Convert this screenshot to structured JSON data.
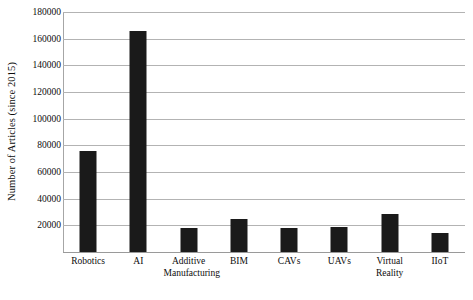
{
  "chart_data": {
    "type": "bar",
    "title": "",
    "subtitle": "",
    "xlabel": "",
    "ylabel": "Number of Articles (since 2015)",
    "categories": [
      "Robotics",
      "AI",
      "Additive\nManufacturing",
      "BIM",
      "CAVs",
      "UAVs",
      "Virtual Reality",
      "IIoT"
    ],
    "values": [
      76000,
      166000,
      18000,
      25000,
      18000,
      18500,
      28500,
      14000
    ],
    "ylim": [
      0,
      180000
    ],
    "ytick_values": [
      0,
      20000,
      40000,
      60000,
      80000,
      100000,
      120000,
      140000,
      160000,
      180000
    ],
    "ytick_labels": [
      "",
      "20000",
      "40000",
      "60000",
      "80000",
      "100000",
      "120000",
      "140000",
      "160000",
      "180000"
    ],
    "grid": "horizontal",
    "legend": "none",
    "bar_color": "#1a1a1a",
    "gridline_color": "#b3b3b3",
    "axis_color": "#a6a6a6",
    "background_color": "#ffffff"
  }
}
